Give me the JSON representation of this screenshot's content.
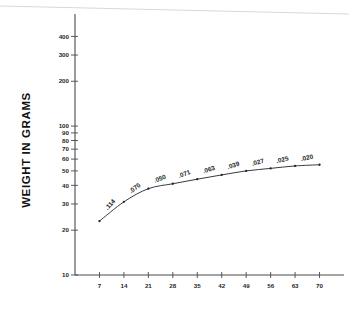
{
  "chart_data": {
    "type": "line",
    "title": "",
    "xlabel": "",
    "ylabel": "WEIGHT IN GRAMS",
    "yscale": "log",
    "ylim": [
      10,
      500
    ],
    "xlim": [
      0,
      77
    ],
    "grid": false,
    "legend": null,
    "x": [
      7,
      14,
      21,
      28,
      35,
      42,
      49,
      56,
      63,
      70
    ],
    "values": [
      23,
      31,
      38,
      41,
      44,
      47,
      50,
      52,
      54,
      55
    ],
    "point_labels": [
      ".114",
      ".070",
      ".050",
      ".071",
      ".063",
      ".039",
      ".027",
      ".025",
      ".020"
    ],
    "y_ticks": [
      10,
      20,
      30,
      40,
      50,
      60,
      70,
      80,
      90,
      100,
      200,
      300,
      400
    ],
    "y_tick_labels": [
      "10",
      "20",
      "30",
      "40",
      "50",
      "60",
      "70",
      "80",
      "90",
      "100",
      "200",
      "300",
      "400"
    ],
    "x_ticks": [
      7,
      14,
      21,
      28,
      35,
      42,
      49,
      56,
      63,
      70
    ],
    "x_tick_labels": [
      "7",
      "14",
      "21",
      "28",
      "35",
      "42",
      "49",
      "56",
      "63",
      "70"
    ]
  }
}
